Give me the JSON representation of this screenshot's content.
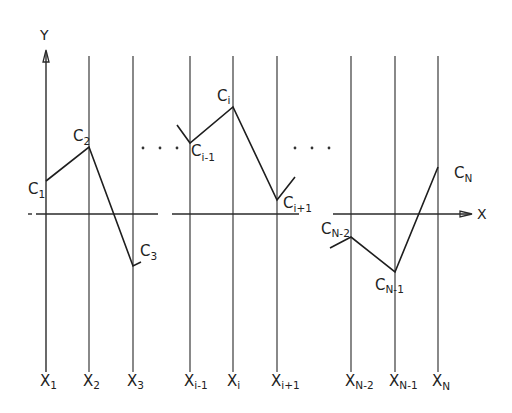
{
  "diagram": {
    "title": "",
    "colors": {
      "ink": "#222222",
      "background": "#ffffff"
    },
    "axes": {
      "y_label": "Y",
      "x_label": "X",
      "x_axis_y": 214
    },
    "grid_lines": [
      {
        "x": 46,
        "label": "X",
        "sub": "1"
      },
      {
        "x": 89,
        "label": "X",
        "sub": "2"
      },
      {
        "x": 133,
        "label": "X",
        "sub": "3"
      },
      {
        "x": 190,
        "label": "X",
        "sub": "i-1"
      },
      {
        "x": 233,
        "label": "X",
        "sub": "i"
      },
      {
        "x": 277,
        "label": "X",
        "sub": "i+1"
      },
      {
        "x": 351,
        "label": "X",
        "sub": "N-2"
      },
      {
        "x": 395,
        "label": "X",
        "sub": "N-1"
      },
      {
        "x": 438,
        "label": "X",
        "sub": "N"
      }
    ],
    "points": [
      {
        "name": "C",
        "sub": "1",
        "x": 46,
        "y": 181
      },
      {
        "name": "C",
        "sub": "2",
        "x": 89,
        "y": 147
      },
      {
        "name": "C",
        "sub": "3",
        "x": 133,
        "y": 266
      },
      {
        "name": "C",
        "sub": "i-1",
        "x": 190,
        "y": 143
      },
      {
        "name": "C",
        "sub": "i",
        "x": 233,
        "y": 107
      },
      {
        "name": "C",
        "sub": "i+1",
        "x": 277,
        "y": 200
      },
      {
        "name": "C",
        "sub": "N-2",
        "x": 351,
        "y": 237
      },
      {
        "name": "C",
        "sub": "N-1",
        "x": 395,
        "y": 272
      },
      {
        "name": "C",
        "sub": "N",
        "x": 438,
        "y": 167
      }
    ],
    "labels": {
      "c1": "C",
      "c1_sub": "1",
      "c2": "C",
      "c2_sub": "2",
      "c3": "C",
      "c3_sub": "3",
      "ci_minus_1": "C",
      "ci_minus_1_sub": "i-1",
      "ci": "C",
      "ci_sub": "i",
      "ci_plus_1": "C",
      "ci_plus_1_sub": "i+1",
      "cn_minus_2": "C",
      "cn_minus_2_sub": "N-2",
      "cn_minus_1": "C",
      "cn_minus_1_sub": "N-1",
      "cn": "C",
      "cn_sub": "N",
      "x1": "X",
      "x1_sub": "1",
      "x2": "X",
      "x2_sub": "2",
      "x3": "X",
      "x3_sub": "3",
      "xi_minus_1": "X",
      "xi_minus_1_sub": "i-1",
      "xi": "X",
      "xi_sub": "i",
      "xi_plus_1": "X",
      "xi_plus_1_sub": "i+1",
      "xn_minus_2": "X",
      "xn_minus_2_sub": "N-2",
      "xn_minus_1": "X",
      "xn_minus_1_sub": "N-1",
      "xn": "X",
      "xn_sub": "N"
    },
    "ellipsis": "· · ·"
  }
}
